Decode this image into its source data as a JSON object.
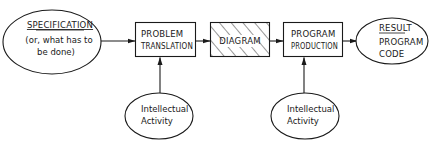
{
  "diagram": {
    "type": "flow",
    "nodes": {
      "specification": {
        "shape": "ellipse",
        "title": "SPECIFICATION",
        "line1": "(or, what has to",
        "line2": "be done)"
      },
      "problem_translation": {
        "shape": "box",
        "line1": "PROBLEM",
        "line2": "TRANSLATION"
      },
      "diagram": {
        "shape": "hatched-box",
        "label": "DIAGRAM"
      },
      "program_production": {
        "shape": "box",
        "line1": "PROGRAM",
        "line2": "PRODUCTION"
      },
      "result": {
        "shape": "ellipse",
        "title": "RESULT",
        "line1": "PROGRAM",
        "line2": "CODE"
      },
      "intellectual_activity_1": {
        "shape": "ellipse",
        "line1": "Intellectual",
        "line2": "Activity"
      },
      "intellectual_activity_2": {
        "shape": "ellipse",
        "line1": "Intellectual",
        "line2": "Activity"
      }
    },
    "edges": [
      {
        "from": "specification",
        "to": "problem_translation"
      },
      {
        "from": "problem_translation",
        "to": "diagram"
      },
      {
        "from": "diagram",
        "to": "program_production"
      },
      {
        "from": "program_production",
        "to": "result"
      },
      {
        "from": "intellectual_activity_1",
        "to": "problem_translation"
      },
      {
        "from": "intellectual_activity_2",
        "to": "program_production"
      }
    ],
    "colors": {
      "stroke": "#1a1a1a",
      "background": "#ffffff"
    }
  }
}
